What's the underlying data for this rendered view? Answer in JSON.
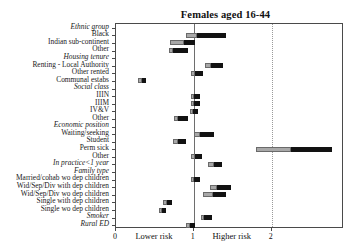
{
  "figure": {
    "top_fragment": "",
    "title": "Females aged 16-44"
  },
  "axis": {
    "ticks": [
      "0",
      "1",
      "2"
    ],
    "tick_values": [
      0,
      1,
      2
    ],
    "low_caption": "Lower risk",
    "high_caption": "Higher risk",
    "xmin": 0,
    "xmax": 2.93
  },
  "chart_data": {
    "type": "bar",
    "orientation": "horizontal",
    "title": "Females aged 16-44",
    "xlabel": "",
    "ylabel": "",
    "xlim": [
      0,
      2.93
    ],
    "grid": false,
    "reference_line": 1,
    "dotted_line": 2,
    "legend": [],
    "annotations": [
      "Lower risk",
      "Higher risk"
    ],
    "note": "Horizontal confidence-interval bars; each bar has a light-grey lower segment and a black upper segment meeting at the point estimate.",
    "categories": [
      {
        "label": "Ethnic group",
        "header": true
      },
      {
        "label": "Black",
        "header": false,
        "low": 0.9,
        "point": 1.04,
        "high": 1.42
      },
      {
        "label": "Indian sub-continent",
        "header": false,
        "low": 0.7,
        "point": 0.88,
        "high": 1.01
      },
      {
        "label": "Other",
        "header": false,
        "low": 0.68,
        "point": 0.73,
        "high": 0.93
      },
      {
        "label": "Housing tenure",
        "header": true
      },
      {
        "label": "Renting - Local Authority",
        "header": false,
        "low": 1.15,
        "point": 1.22,
        "high": 1.38
      },
      {
        "label": "Other rented",
        "header": false,
        "low": 0.97,
        "point": 1.02,
        "high": 1.12
      },
      {
        "label": "Communal estabs",
        "header": false,
        "low": 0.28,
        "point": 0.33,
        "high": 0.39
      },
      {
        "label": "Social class",
        "header": true
      },
      {
        "label": "IIIN",
        "header": false,
        "low": 0.96,
        "point": 1.0,
        "high": 1.08
      },
      {
        "label": "IIIM",
        "header": false,
        "low": 0.96,
        "point": 1.0,
        "high": 1.08
      },
      {
        "label": "IV&V",
        "header": false,
        "low": 0.95,
        "point": 0.99,
        "high": 1.05
      },
      {
        "label": "Other",
        "header": false,
        "low": 0.74,
        "point": 0.8,
        "high": 0.92
      },
      {
        "label": "Economic position",
        "header": true
      },
      {
        "label": "Waiting/seeking",
        "header": false,
        "low": 1.0,
        "point": 1.08,
        "high": 1.26
      },
      {
        "label": "Student",
        "header": false,
        "low": 0.73,
        "point": 0.8,
        "high": 0.9
      },
      {
        "label": "Perm sick",
        "header": false,
        "low": 1.8,
        "point": 2.25,
        "high": 2.78
      },
      {
        "label": "Other",
        "header": false,
        "low": 0.97,
        "point": 1.01,
        "high": 1.1
      },
      {
        "label": "In practice<1 year",
        "header": true,
        "low": 1.18,
        "point": 1.26,
        "high": 1.36
      },
      {
        "label": "Family type",
        "header": true
      },
      {
        "label": "Married/cohab wo dep children",
        "header": false,
        "low": 0.96,
        "point": 1.0,
        "high": 1.08
      },
      {
        "label": "Wid/Sep/Div with dep children",
        "header": false,
        "low": 1.21,
        "point": 1.3,
        "high": 1.48
      },
      {
        "label": "Wid/Sep/Div wo dep children",
        "header": false,
        "low": 1.12,
        "point": 1.25,
        "high": 1.42
      },
      {
        "label": "Single with dep children",
        "header": false,
        "low": 0.6,
        "point": 0.65,
        "high": 0.72
      },
      {
        "label": "Single wo dep children",
        "header": false,
        "low": 0.55,
        "point": 0.59,
        "high": 0.64
      },
      {
        "label": "Smoker",
        "header": true,
        "low": 1.09,
        "point": 1.13,
        "high": 1.24
      },
      {
        "label": "Rural ED",
        "header": true,
        "low": 0.9,
        "point": 0.95,
        "high": 1.01
      }
    ]
  },
  "colors": {
    "bar_low": "#a8a8a8",
    "bar_high": "#121212",
    "axis": "#4a4a4a",
    "refline": "#6e6e6e",
    "dotline": "#9a9a9a",
    "background": "#ffffff"
  }
}
